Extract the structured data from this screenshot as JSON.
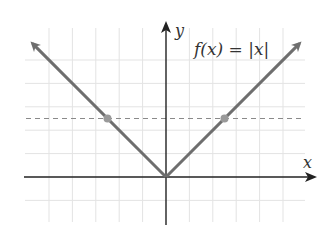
{
  "chart_data": {
    "type": "line",
    "title": "",
    "function_label": "f(x) = |x|",
    "xlabel": "x",
    "ylabel": "y",
    "xlim": [
      -6,
      6
    ],
    "ylim": [
      -1,
      5
    ],
    "grid": true,
    "grid_step": 1,
    "series": [
      {
        "name": "f(x) = |x|",
        "x": [
          -5.7,
          0,
          5.7
        ],
        "y": [
          5.7,
          0,
          5.7
        ],
        "color": "#6e6e6e",
        "arrows": true
      }
    ],
    "reference_lines": [
      {
        "orientation": "horizontal",
        "y": 2.5,
        "style": "dashed",
        "color": "#8a8a8a"
      }
    ],
    "points": [
      {
        "x": -2.5,
        "y": 2.5,
        "color": "#9a9a9a"
      },
      {
        "x": 2.5,
        "y": 2.5,
        "color": "#9a9a9a"
      }
    ]
  },
  "labels": {
    "function": "f(x) = |x|",
    "x_axis": "x",
    "y_axis": "y"
  },
  "colors": {
    "axis": "#222222",
    "grid": "#e3e3e3",
    "curve": "#6e6e6e",
    "dashed": "#8a8a8a",
    "point": "#9a9a9a"
  }
}
